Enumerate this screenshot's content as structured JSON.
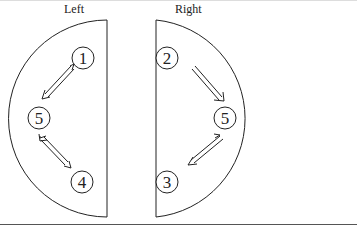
{
  "diagram": {
    "left": {
      "title": "Left",
      "nodes": [
        {
          "id": "1",
          "label": "1",
          "cx": 83,
          "cy": 58
        },
        {
          "id": "5",
          "label": "5",
          "cx": 39,
          "cy": 118
        },
        {
          "id": "4",
          "label": "4",
          "cx": 82,
          "cy": 182
        }
      ],
      "edges": [
        {
          "from": "1",
          "to": "5",
          "type": "bidirectional-double-line"
        },
        {
          "from": "4",
          "to": "5",
          "type": "bidirectional-double-line"
        }
      ]
    },
    "right": {
      "title": "Right",
      "nodes": [
        {
          "id": "2",
          "label": "2",
          "cx": 167,
          "cy": 58
        },
        {
          "id": "5",
          "label": "5",
          "cx": 225,
          "cy": 118
        },
        {
          "id": "3",
          "label": "3",
          "cx": 167,
          "cy": 182
        }
      ],
      "edges": [
        {
          "from": "2",
          "to": "5",
          "type": "double-line-arrow"
        },
        {
          "from": "5",
          "to": "3",
          "type": "double-line-arrow"
        }
      ]
    },
    "colors": {
      "stroke": "#222222",
      "background": "#ffffff"
    }
  }
}
